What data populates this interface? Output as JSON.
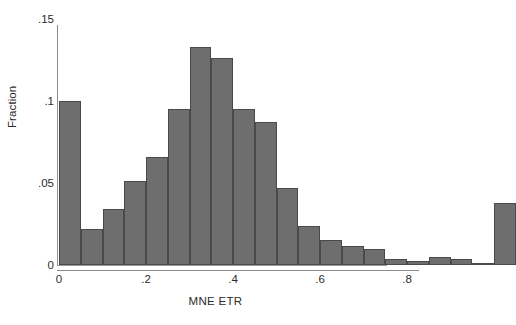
{
  "chart_data": {
    "type": "bar",
    "title": "",
    "subtitle": "",
    "xlabel": "MNE ETR",
    "ylabel": "Fraction",
    "xlim": [
      0,
      0.8
    ],
    "ylim": [
      0,
      0.15
    ],
    "grid": false,
    "legend": null,
    "bin_width": 0.05,
    "bar_color": "#6e6e6e",
    "bar_edge_color": "#4a4a4a",
    "axis_color": "#8c8c8c",
    "text_color": "#2b2b2b",
    "xticks": [
      {
        "value": 0,
        "label": "0"
      },
      {
        "value": 0.2,
        "label": ".2"
      },
      {
        "value": 0.4,
        "label": ".4"
      },
      {
        "value": 0.6,
        "label": ".6"
      },
      {
        "value": 0.8,
        "label": ".8"
      }
    ],
    "yticks": [
      {
        "value": 0.15,
        "label": ".15"
      },
      {
        "value": 0.1,
        "label": ".1"
      },
      {
        "value": 0.05,
        "label": ".05"
      },
      {
        "value": 0,
        "label": "0"
      }
    ],
    "bins": [
      {
        "x0": 0.0,
        "x1": 0.05,
        "value": 0.1
      },
      {
        "x0": 0.05,
        "x1": 0.1,
        "value": 0.022
      },
      {
        "x0": 0.1,
        "x1": 0.15,
        "value": 0.034
      },
      {
        "x0": 0.15,
        "x1": 0.2,
        "value": 0.051
      },
      {
        "x0": 0.2,
        "x1": 0.25,
        "value": 0.066
      },
      {
        "x0": 0.25,
        "x1": 0.3,
        "value": 0.095
      },
      {
        "x0": 0.3,
        "x1": 0.35,
        "value": 0.133
      },
      {
        "x0": 0.35,
        "x1": 0.4,
        "value": 0.126
      },
      {
        "x0": 0.4,
        "x1": 0.45,
        "value": 0.095
      },
      {
        "x0": 0.45,
        "x1": 0.5,
        "value": 0.087
      },
      {
        "x0": 0.5,
        "x1": 0.55,
        "value": 0.047
      },
      {
        "x0": 0.55,
        "x1": 0.6,
        "value": 0.024
      },
      {
        "x0": 0.6,
        "x1": 0.65,
        "value": 0.015
      },
      {
        "x0": 0.65,
        "x1": 0.7,
        "value": 0.0115
      },
      {
        "x0": 0.7,
        "x1": 0.75,
        "value": 0.01
      },
      {
        "x0": 0.75,
        "x1": 0.8,
        "value": 0.0035
      },
      {
        "x0": 0.8,
        "x1": 0.85,
        "value": 0.0025
      },
      {
        "x0": 0.85,
        "x1": 0.9,
        "value": 0.005
      },
      {
        "x0": 0.9,
        "x1": 0.95,
        "value": 0.0035
      },
      {
        "x0": 0.95,
        "x1": 1.0,
        "value": 0.0015
      },
      {
        "x0": 1.0,
        "x1": 1.05,
        "value": 0.038
      }
    ]
  }
}
